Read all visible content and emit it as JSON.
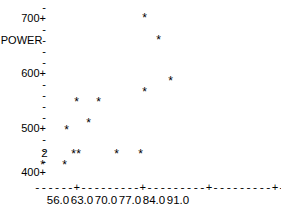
{
  "chart_data": {
    "type": "scatter",
    "title": "",
    "xlabel": "MASS",
    "ylabel": "POWER",
    "render_mode": "character-cell ASCII plot",
    "xlim": [
      52.5,
      94.5
    ],
    "ylim": [
      400,
      710
    ],
    "xticks": [
      "56.0",
      "63.0",
      "70.0",
      "77.0",
      "84.0",
      "91.0"
    ],
    "xtick_values": [
      56.0,
      63.0,
      70.0,
      77.0,
      84.0,
      91.0
    ],
    "yticks": [
      "700+",
      "600+",
      "500+",
      "400+"
    ],
    "ytick_values": [
      700,
      600,
      500,
      400
    ],
    "grid": false,
    "legend": null,
    "marker": "*",
    "overlap_marker_note": "digit shows number of coincident observations",
    "points": [
      {
        "x": 76.5,
        "y": 702,
        "glyph": "*",
        "count": 1
      },
      {
        "x": 80.5,
        "y": 643,
        "glyph": "*",
        "count": 1
      },
      {
        "x": 83.0,
        "y": 583,
        "glyph": "*",
        "count": 1
      },
      {
        "x": 76.5,
        "y": 572,
        "glyph": "*",
        "count": 1
      },
      {
        "x": 62.0,
        "y": 541,
        "glyph": "*",
        "count": 1
      },
      {
        "x": 68.0,
        "y": 541,
        "glyph": "*",
        "count": 1
      },
      {
        "x": 64.5,
        "y": 510,
        "glyph": "*",
        "count": 1
      },
      {
        "x": 59.0,
        "y": 490,
        "glyph": "*",
        "count": 1
      },
      {
        "x": 55.5,
        "y": 430,
        "glyph": "*",
        "count": 1
      },
      {
        "x": 61.5,
        "y": 430,
        "glyph": "*",
        "count": 1
      },
      {
        "x": 57.5,
        "y": 441,
        "glyph": "2",
        "count": 2
      },
      {
        "x": 64.0,
        "y": 441,
        "glyph": "*",
        "count": 1
      },
      {
        "x": 65.5,
        "y": 441,
        "glyph": "*",
        "count": 1
      },
      {
        "x": 73.0,
        "y": 441,
        "glyph": "*",
        "count": 1
      },
      {
        "x": 79.5,
        "y": 441,
        "glyph": "*",
        "count": 1
      }
    ]
  },
  "axes": {
    "y": {
      "label_text": "POWER-",
      "rows": [
        {
          "top": 2,
          "text": "-",
          "kind": "tick"
        },
        {
          "top": 13,
          "text": "700+",
          "kind": "label"
        },
        {
          "top": 24,
          "text": "-",
          "kind": "tick"
        },
        {
          "top": 35,
          "text": "POWER-",
          "kind": "axis-title"
        },
        {
          "top": 46,
          "text": "-",
          "kind": "tick"
        },
        {
          "top": 57,
          "text": "-",
          "kind": "tick"
        },
        {
          "top": 68,
          "text": "600+",
          "kind": "label"
        },
        {
          "top": 79,
          "text": "-",
          "kind": "tick"
        },
        {
          "top": 90,
          "text": "-",
          "kind": "tick"
        },
        {
          "top": 101,
          "text": "-",
          "kind": "tick"
        },
        {
          "top": 112,
          "text": "-",
          "kind": "tick"
        },
        {
          "top": 123,
          "text": "500+",
          "kind": "label"
        },
        {
          "top": 134,
          "text": "-",
          "kind": "tick"
        },
        {
          "top": 145,
          "text": "-",
          "kind": "tick"
        },
        {
          "top": 156,
          "text": "-",
          "kind": "tick"
        },
        {
          "top": 167,
          "text": "400+",
          "kind": "label"
        }
      ]
    },
    "x": {
      "rule_text": "------+---------+---------+---------+---------+---------+MASS",
      "axis_title": "MASS",
      "tick_labels": [
        {
          "text": "56.0",
          "left": 58
        },
        {
          "text": "63.0",
          "left": 82
        },
        {
          "text": "70.0",
          "left": 106
        },
        {
          "text": "77.0",
          "left": 130
        },
        {
          "text": "84.0",
          "left": 154
        },
        {
          "text": "91.0",
          "left": 178
        }
      ]
    }
  },
  "markers": [
    {
      "glyph": "*",
      "left": 141,
      "top": 14
    },
    {
      "glyph": "*",
      "left": 155,
      "top": 36
    },
    {
      "glyph": "*",
      "left": 167,
      "top": 77
    },
    {
      "glyph": "*",
      "left": 141,
      "top": 88
    },
    {
      "glyph": "*",
      "left": 73,
      "top": 98
    },
    {
      "glyph": "*",
      "left": 95,
      "top": 98
    },
    {
      "glyph": "*",
      "left": 85,
      "top": 119
    },
    {
      "glyph": "*",
      "left": 63,
      "top": 126
    },
    {
      "glyph": "2",
      "left": 41,
      "top": 148
    },
    {
      "glyph": "*",
      "left": 70,
      "top": 150
    },
    {
      "glyph": "*",
      "left": 75,
      "top": 150
    },
    {
      "glyph": "*",
      "left": 113,
      "top": 150
    },
    {
      "glyph": "*",
      "left": 137,
      "top": 150
    },
    {
      "glyph": "*",
      "left": 39,
      "top": 161
    },
    {
      "glyph": "*",
      "left": 61,
      "top": 161
    }
  ]
}
